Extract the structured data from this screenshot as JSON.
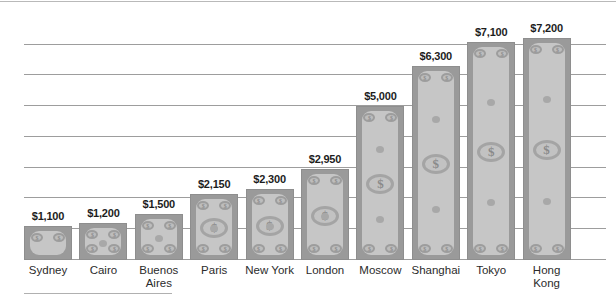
{
  "chart_data": {
    "type": "bar",
    "title": "",
    "subtitle": "",
    "xlabel": "",
    "ylabel": "",
    "categories": [
      "Sydney",
      "Cairo",
      "Buenos\nAires",
      "Paris",
      "New York",
      "London",
      "Moscow",
      "Shanghai",
      "Tokyo",
      "Hong\nKong"
    ],
    "values": [
      1100,
      1200,
      1500,
      2150,
      2300,
      2950,
      5000,
      6300,
      7100,
      7200
    ],
    "value_labels": [
      "$1,100",
      "$1,200",
      "$1,500",
      "$2,150",
      "$2,300",
      "$2,950",
      "$5,000",
      "$6,300",
      "$7,100",
      "$7,200"
    ],
    "ylim": [
      0,
      7800
    ],
    "gridlines": [
      1000,
      2000,
      3000,
      4000,
      5000,
      6000,
      7000
    ],
    "grid": true,
    "legend": null,
    "bar_style": "banknote-pictograph",
    "colors": {
      "bar_fill": "#9a9a9a",
      "bar_inner": "#c6c6c6",
      "bar_border": "#8e8e8e",
      "gridline": "#9d9d9d",
      "label_text": "#1d1d1d",
      "category_text": "#2b2b2b",
      "background": "#ffffff"
    },
    "seal_glyph": "$",
    "medallion_glyph": "$"
  }
}
